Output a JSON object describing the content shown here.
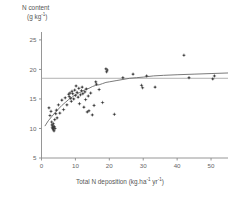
{
  "chart_data": {
    "type": "scatter",
    "title": "",
    "ylabel_line1": "N content",
    "ylabel_line2": "(g kg",
    "ylabel_sup": "-1",
    "ylabel_close": ")",
    "xlabel_main": "Total N deposition (kg.ha",
    "xlabel_sup1": "-1",
    "xlabel_mid": " yr",
    "xlabel_sup2": "-1",
    "xlabel_close": ")",
    "xlabel_full": "Total N deposition (kg.ha-1 yr-1)",
    "ylabel_full": "N content (g kg-1)",
    "xlim": [
      0,
      55
    ],
    "ylim": [
      5,
      26
    ],
    "xticks": [
      0,
      10,
      20,
      30,
      40,
      50
    ],
    "yticks": [
      5,
      10,
      15,
      20,
      25
    ],
    "grid": false,
    "legend": "none",
    "marker": "plus-dot",
    "marker_color": "#3a3a3a",
    "axis_color": "#8a8a8a",
    "curve_color": "#6b6b6b",
    "hline_color": "#a8a8a8",
    "asymptote_value": 18.5,
    "fit_curve_note": "saturating curve rising from ~10.5 at x=1 to ~19.3 at x=55",
    "fit_curve": [
      [
        1.0,
        10.4
      ],
      [
        2.0,
        11.3
      ],
      [
        3.0,
        12.0
      ],
      [
        4.0,
        12.7
      ],
      [
        5.0,
        13.3
      ],
      [
        6.0,
        13.9
      ],
      [
        7.0,
        14.4
      ],
      [
        8.0,
        14.9
      ],
      [
        9.0,
        15.3
      ],
      [
        10.0,
        15.7
      ],
      [
        11.0,
        16.0
      ],
      [
        12.0,
        16.3
      ],
      [
        13.0,
        16.6
      ],
      [
        14.0,
        16.8
      ],
      [
        15.0,
        17.1
      ],
      [
        16.0,
        17.3
      ],
      [
        17.0,
        17.4
      ],
      [
        18.0,
        17.6
      ],
      [
        19.0,
        17.8
      ],
      [
        20.0,
        17.9
      ],
      [
        22.0,
        18.1
      ],
      [
        24.0,
        18.3
      ],
      [
        26.0,
        18.5
      ],
      [
        28.0,
        18.6
      ],
      [
        30.0,
        18.7
      ],
      [
        33.0,
        18.9
      ],
      [
        36.0,
        19.0
      ],
      [
        40.0,
        19.1
      ],
      [
        45.0,
        19.2
      ],
      [
        50.0,
        19.3
      ],
      [
        55.0,
        19.4
      ]
    ],
    "points": [
      [
        2.2,
        13.5
      ],
      [
        2.5,
        12.2
      ],
      [
        2.8,
        12.9
      ],
      [
        3.0,
        11.1
      ],
      [
        3.1,
        10.6
      ],
      [
        3.2,
        10.2
      ],
      [
        3.3,
        10.0
      ],
      [
        3.4,
        10.4
      ],
      [
        3.5,
        9.8
      ],
      [
        3.5,
        10.8
      ],
      [
        3.6,
        10.1
      ],
      [
        3.7,
        9.6
      ],
      [
        3.8,
        10.3
      ],
      [
        3.9,
        11.5
      ],
      [
        4.0,
        10.0
      ],
      [
        4.2,
        12.5
      ],
      [
        4.4,
        13.1
      ],
      [
        4.6,
        11.8
      ],
      [
        5.0,
        14.0
      ],
      [
        5.4,
        12.6
      ],
      [
        6.0,
        14.8
      ],
      [
        6.5,
        13.2
      ],
      [
        7.0,
        15.2
      ],
      [
        7.5,
        14.0
      ],
      [
        8.0,
        15.8
      ],
      [
        8.2,
        15.4
      ],
      [
        8.4,
        16.0
      ],
      [
        8.6,
        15.1
      ],
      [
        8.8,
        14.6
      ],
      [
        9.0,
        16.3
      ],
      [
        9.2,
        15.9
      ],
      [
        9.5,
        15.0
      ],
      [
        9.8,
        16.5
      ],
      [
        10.0,
        15.6
      ],
      [
        10.2,
        17.2
      ],
      [
        10.5,
        16.1
      ],
      [
        10.8,
        15.3
      ],
      [
        11.0,
        16.8
      ],
      [
        11.2,
        14.2
      ],
      [
        11.5,
        15.7
      ],
      [
        11.8,
        16.4
      ],
      [
        12.0,
        17.0
      ],
      [
        12.2,
        15.9
      ],
      [
        12.5,
        13.6
      ],
      [
        12.8,
        16.2
      ],
      [
        13.0,
        14.9
      ],
      [
        13.2,
        16.7
      ],
      [
        13.5,
        12.8
      ],
      [
        13.8,
        15.5
      ],
      [
        14.0,
        13.0
      ],
      [
        14.5,
        16.0
      ],
      [
        15.0,
        12.3
      ],
      [
        15.5,
        13.9
      ],
      [
        16.0,
        17.9
      ],
      [
        16.2,
        17.5
      ],
      [
        17.0,
        16.6
      ],
      [
        18.0,
        14.4
      ],
      [
        19.0,
        20.1
      ],
      [
        19.2,
        19.6
      ],
      [
        19.4,
        19.9
      ],
      [
        21.5,
        12.4
      ],
      [
        24.0,
        18.6
      ],
      [
        27.0,
        19.2
      ],
      [
        29.5,
        17.3
      ],
      [
        29.8,
        16.9
      ],
      [
        31.0,
        18.9
      ],
      [
        33.5,
        17.0
      ],
      [
        42.0,
        22.4
      ],
      [
        43.5,
        18.6
      ],
      [
        50.5,
        18.4
      ],
      [
        51.0,
        18.9
      ]
    ]
  }
}
